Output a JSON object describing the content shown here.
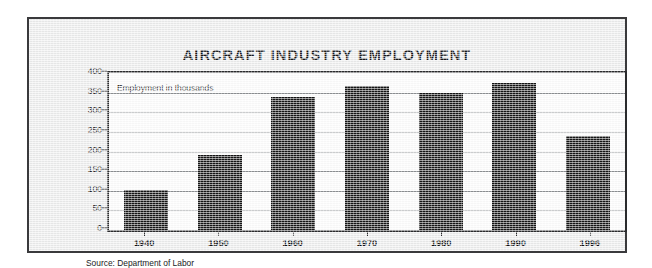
{
  "chart_data": {
    "type": "bar",
    "title": "AIRCRAFT INDUSTRY EMPLOYMENT",
    "subtitle": "Employment in thousands",
    "xlabel": "",
    "ylabel": "Employment in thousands",
    "categories": [
      "1940",
      "1950",
      "1960",
      "1970",
      "1980",
      "1990",
      "1996"
    ],
    "values": [
      102,
      190,
      340,
      368,
      348,
      375,
      240
    ],
    "ylim": [
      0,
      400
    ],
    "ytick_values": [
      0,
      50,
      100,
      150,
      200,
      250,
      300,
      350,
      400
    ],
    "ytick_labels": [
      "0",
      "50",
      "100",
      "150",
      "200",
      "250",
      "300",
      "350",
      "400"
    ],
    "grid": true,
    "legend": "none",
    "source": "Source:  Department of Labor",
    "bar_color": "#141414",
    "plot_background": "#fdfdfd",
    "gridline_color": "#8d9093",
    "frame_color": "#2a2b2d",
    "paper_color": "#eceded"
  }
}
